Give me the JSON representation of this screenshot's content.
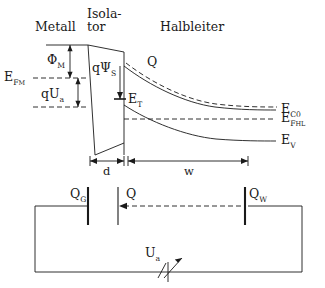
{
  "figure": {
    "title_regions": {
      "metal": "Metall",
      "insulator_line1": "Isola-",
      "insulator_line2": "tor",
      "semiconductor": "Halbleiter"
    },
    "labels": {
      "phi_m": "Φ",
      "phi_m_sub": "M",
      "e_fm": "E",
      "e_fm_sub": "F",
      "e_fm_sub2": "M",
      "q_ua": "qU",
      "q_ua_sub": "a",
      "q_psi_s": "qΨ",
      "q_psi_s_sub": "S",
      "e_t": "E",
      "e_t_sub": "T",
      "q_charge": "Q",
      "e_c0": "E",
      "e_c0_sub": "C0",
      "e_fhl": "E",
      "e_fhl_sub": "F",
      "e_fhl_sub2": "HL",
      "e_v": "E",
      "e_v_sub": "V",
      "dim_d": "d",
      "dim_w": "w"
    },
    "circuit": {
      "q_g": "Q",
      "q_g_sub": "G",
      "q_mid": "Q",
      "q_w": "Q",
      "q_w_sub": "W",
      "u_a": "U",
      "u_a_sub": "a"
    },
    "colors": {
      "line": "#1a1a1a",
      "background": "#ffffff"
    }
  }
}
